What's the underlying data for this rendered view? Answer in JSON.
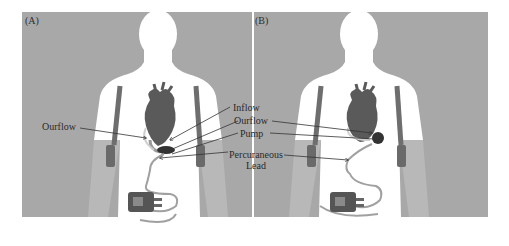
{
  "figure": {
    "background_color": "#a8a8a8",
    "silhouette_color": "#ffffff",
    "strap_color": "#6e6e6e",
    "heart_color": "#5a5a5a",
    "device_color": "#555555",
    "panels": [
      {
        "id": "A",
        "label": "(A)",
        "device_position": "pump below heart at apex (subdiaphragmatic)"
      },
      {
        "id": "B",
        "label": "(B)",
        "device_position": "pump at heart apex (intrapericardial)"
      }
    ],
    "callouts": {
      "outflow_left": "Ourflow",
      "inflow": "Inflow",
      "outflow": "Ourflow",
      "pump": "Pump",
      "percutaneous_line1": "Percuraneous",
      "percutaneous_line2": "Lead"
    }
  }
}
